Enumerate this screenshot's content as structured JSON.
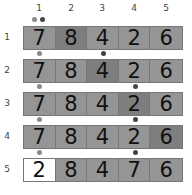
{
  "columns": [
    "1",
    "2",
    "3",
    "4",
    "5"
  ],
  "rows": [
    {
      "label": "1",
      "values": [
        "7",
        "8",
        "4",
        "2",
        "6"
      ],
      "shades": [
        "#959595",
        "#7e7e7e",
        "#959595",
        "#959595",
        "#959595"
      ]
    },
    {
      "label": "2",
      "values": [
        "7",
        "8",
        "4",
        "2",
        "6"
      ],
      "shades": [
        "#959595",
        "#959595",
        "#7e7e7e",
        "#959595",
        "#959595"
      ]
    },
    {
      "label": "3",
      "values": [
        "7",
        "8",
        "4",
        "2",
        "6"
      ],
      "shades": [
        "#959595",
        "#959595",
        "#959595",
        "#7e7e7e",
        "#959595"
      ]
    },
    {
      "label": "4",
      "values": [
        "7",
        "8",
        "4",
        "2",
        "6"
      ],
      "shades": [
        "#959595",
        "#959595",
        "#959595",
        "#959595",
        "#7e7e7e"
      ]
    },
    {
      "label": "5",
      "values": [
        "2",
        "8",
        "4",
        "7",
        "6"
      ],
      "shades": [
        "#ffffff",
        "#959595",
        "#959595",
        "#959595",
        "#959595"
      ]
    }
  ],
  "colors": {
    "dot_light": "#8a8a8a",
    "dot_dark": "#444444"
  }
}
